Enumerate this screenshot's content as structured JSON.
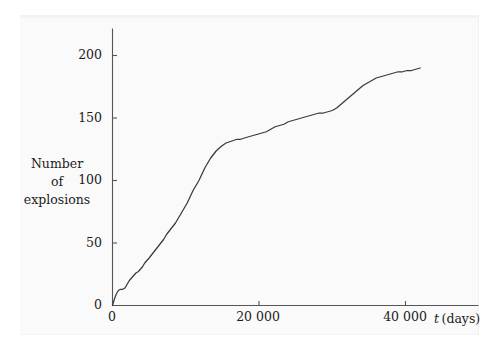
{
  "figure": {
    "background_color": "#ffffff",
    "panel_color": "#fafafa",
    "curve_color": "#3a3a3a",
    "axis_color": "#555555",
    "text_color": "#1c1c1c"
  },
  "axes": {
    "y_label_lines": [
      "Number",
      "of",
      "explosions"
    ],
    "y_ticks": [
      "0",
      "50",
      "100",
      "150",
      "200"
    ],
    "x_ticks": [
      "0",
      "20 000",
      "40 000"
    ],
    "x_title_symbol": "t",
    "x_title_unit": "(days)"
  },
  "chart_data": {
    "type": "line",
    "title": "",
    "subtitle": "",
    "xlabel": "t (days)",
    "ylabel": "Number of explosions",
    "xlim": [
      0,
      50100
    ],
    "ylim": [
      0,
      222
    ],
    "xticks": [
      0,
      20000,
      40000
    ],
    "xticklabels": [
      "0",
      "20 000",
      "40 000"
    ],
    "yticks": [
      0,
      50,
      100,
      150,
      200
    ],
    "yticklabels": [
      "0",
      "50",
      "100",
      "150",
      "200"
    ],
    "grid": false,
    "legend": null,
    "annotations": [],
    "series": [
      {
        "name": "cumulative explosions",
        "x": [
          0,
          250,
          500,
          800,
          1100,
          1400,
          1700,
          2000,
          2300,
          2600,
          2900,
          3200,
          3500,
          3800,
          4100,
          4400,
          4700,
          5000,
          5400,
          5800,
          6200,
          6600,
          7000,
          7400,
          7800,
          8200,
          8600,
          9000,
          9400,
          9800,
          10200,
          10600,
          11000,
          11400,
          11800,
          12200,
          12600,
          13000,
          13400,
          13800,
          14200,
          14600,
          15000,
          15500,
          16000,
          16500,
          17000,
          17500,
          18000,
          18600,
          19200,
          19800,
          20400,
          21000,
          21600,
          22200,
          22800,
          23400,
          24000,
          24600,
          25200,
          25800,
          26400,
          27000,
          27600,
          28200,
          28800,
          29400,
          30000,
          30600,
          31200,
          31800,
          32400,
          33000,
          33600,
          34200,
          34800,
          35400,
          36000,
          36600,
          37200,
          37800,
          38400,
          39000,
          39600,
          40200,
          40800,
          41400,
          42000
        ],
        "y": [
          0,
          5,
          9,
          12,
          13,
          13,
          14,
          17,
          20,
          22,
          24,
          26,
          27,
          29,
          31,
          34,
          36,
          38,
          41,
          44,
          47,
          50,
          53,
          57,
          60,
          63,
          66,
          70,
          74,
          78,
          82,
          87,
          92,
          96,
          100,
          105,
          110,
          114,
          118,
          121,
          124,
          126,
          128,
          130,
          131,
          132,
          133,
          133,
          134,
          135,
          136,
          137,
          138,
          139,
          141,
          143,
          144,
          145,
          147,
          148,
          149,
          150,
          151,
          152,
          153,
          154,
          154,
          155,
          156,
          158,
          161,
          164,
          167,
          170,
          173,
          176,
          178,
          180,
          182,
          183,
          184,
          185,
          186,
          187,
          187,
          188,
          188,
          189,
          190
        ]
      }
    ]
  }
}
